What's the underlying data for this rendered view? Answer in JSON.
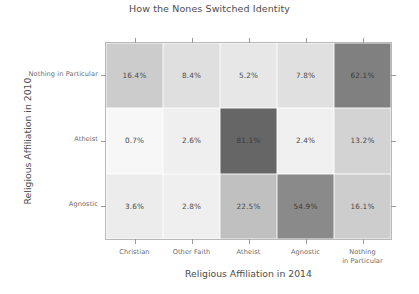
{
  "chart_data": {
    "type": "heatmap",
    "title": "How the Nones Switched Identity",
    "xlabel": "Religious Affiliation in 2014",
    "ylabel": "Religious Affiliation in 2010",
    "x_categories": [
      "Christian",
      "Other Faith",
      "Atheist",
      "Agnostic",
      "Nothing in Particular"
    ],
    "y_categories": [
      "Nothing in Particular",
      "Atheist",
      "Agnostic"
    ],
    "values": [
      [
        16.4,
        8.4,
        5.2,
        7.8,
        62.1
      ],
      [
        0.7,
        2.6,
        81.1,
        2.4,
        13.2
      ],
      [
        3.6,
        2.8,
        22.5,
        54.9,
        16.1
      ]
    ],
    "cell_labels": [
      [
        "16.4%",
        "8.4%",
        "5.2%",
        "7.8%",
        "62.1%"
      ],
      [
        "0.7%",
        "2.6%",
        "81.1%",
        "2.4%",
        "13.2%"
      ],
      [
        "3.6%",
        "2.8%",
        "22.5%",
        "54.9%",
        "16.1%"
      ]
    ],
    "colorscale": "greys",
    "vmin": 0,
    "vmax": 100,
    "grid": false,
    "legend": "none",
    "colors": {
      "low": "#ffffff",
      "high": "#4d4d4d",
      "text": "#4a4a4a",
      "axis": "#9a9a9a",
      "border": "#b8b8b8",
      "background": "#ffffff"
    }
  },
  "x_tick_lines": [
    [
      "Christian"
    ],
    [
      "Other Faith"
    ],
    [
      "Atheist"
    ],
    [
      "Agnostic"
    ],
    [
      "Nothing",
      "in Particular"
    ]
  ]
}
